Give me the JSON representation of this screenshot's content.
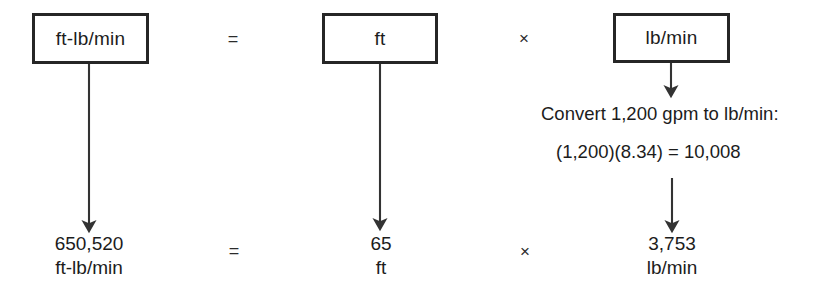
{
  "diagram": {
    "title_row": {
      "box1_label": "ft-lb/min",
      "op1": "=",
      "box2_label": "ft",
      "op2": "×",
      "box3_label": "lb/min"
    },
    "annotation": {
      "line1": "Convert 1,200 gpm to lb/min:",
      "line2": "(1,200)(8.34)  =  10,008"
    },
    "result_row": {
      "value1_number": "650,520",
      "value1_unit": "ft-lb/min",
      "op1": "=",
      "value2_number": "65",
      "value2_unit": "ft",
      "op2": "×",
      "value3_number": "3,753",
      "value3_unit": "lb/min"
    },
    "colors": {
      "box_border": "#262626",
      "text": "#1c1c1c",
      "arrow": "#333333",
      "background": "#ffffff"
    }
  }
}
